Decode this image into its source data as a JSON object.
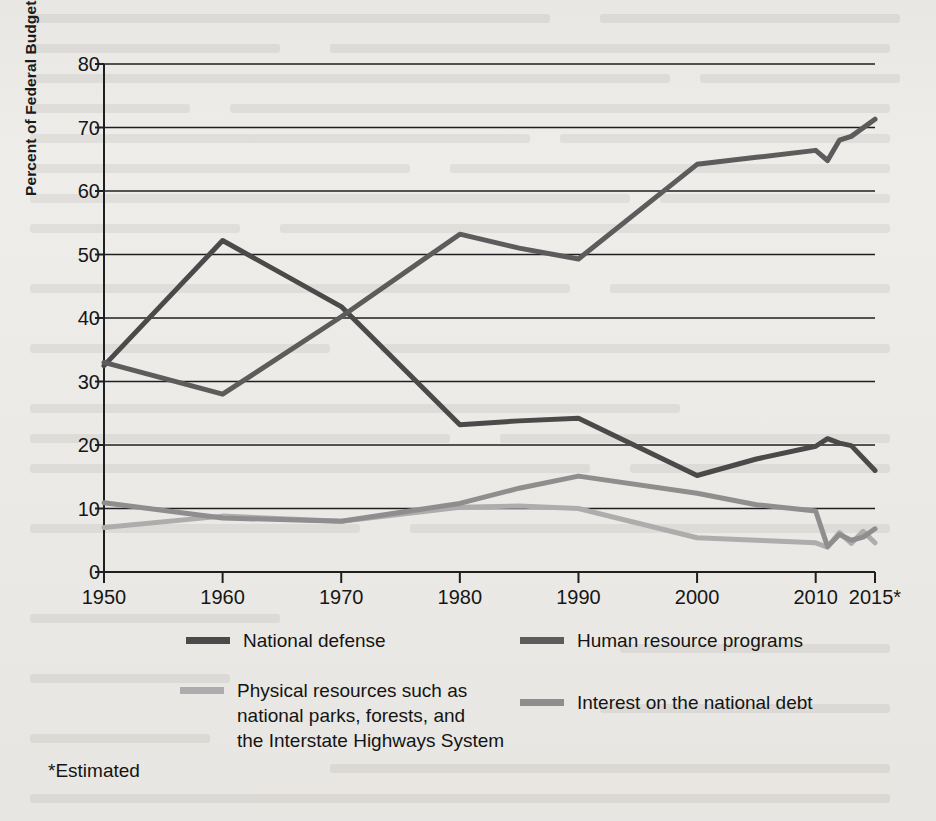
{
  "figure": {
    "y_axis_title": "Percent of Federal Budget",
    "footnote": "*Estimated"
  },
  "legend": {
    "items": [
      {
        "label": "National defense",
        "color": "#4a4a4a"
      },
      {
        "label": "Human resource programs",
        "color": "#5c5c5c"
      },
      {
        "label": "Physical resources such as\nnational parks, forests, and\nthe Interstate Highways System",
        "color": "#adadad"
      },
      {
        "label": "Interest on the national debt",
        "color": "#8e8e8e"
      }
    ]
  },
  "chart_data": {
    "type": "line",
    "title": "",
    "xlabel": "",
    "ylabel": "Percent of Federal Budget",
    "xlim": [
      1950,
      2015
    ],
    "ylim": [
      0,
      80
    ],
    "grid": true,
    "legend_position": "bottom",
    "x_tick_labels": [
      "1950",
      "1960",
      "1970",
      "1980",
      "1990",
      "2000",
      "2010",
      "2015*"
    ],
    "x_ticks": [
      1950,
      1960,
      1970,
      1980,
      1990,
      2000,
      2010,
      2015
    ],
    "y_tick_labels": [
      "0",
      "10",
      "20",
      "30",
      "40",
      "50",
      "60",
      "70",
      "80"
    ],
    "y_ticks": [
      0,
      10,
      20,
      30,
      40,
      50,
      60,
      70,
      80
    ],
    "series": [
      {
        "name": "National defense",
        "color": "#4a4a4a",
        "x": [
          1950,
          1960,
          1970,
          1980,
          1985,
          1990,
          2000,
          2005,
          2010,
          2011,
          2012,
          2013,
          2015
        ],
        "values": [
          32.5,
          52.2,
          41.8,
          23.2,
          23.8,
          24.2,
          15.2,
          17.8,
          19.8,
          21.0,
          20.3,
          19.9,
          16.0
        ]
      },
      {
        "name": "Human resource programs",
        "color": "#5c5c5c",
        "x": [
          1950,
          1960,
          1970,
          1980,
          1985,
          1990,
          2000,
          2005,
          2010,
          2011,
          2012,
          2013,
          2015
        ],
        "values": [
          33.0,
          28.0,
          40.2,
          53.2,
          51.0,
          49.3,
          64.2,
          65.3,
          66.4,
          64.8,
          68.0,
          68.6,
          71.3
        ]
      },
      {
        "name": "Physical resources such as national parks, forests, and the Interstate Highways System",
        "color": "#adadad",
        "x": [
          1950,
          1960,
          1970,
          1980,
          1985,
          1990,
          2000,
          2005,
          2010,
          2011,
          2012,
          2013,
          2014,
          2015
        ],
        "values": [
          7.0,
          8.8,
          8.0,
          10.2,
          10.4,
          10.0,
          5.4,
          5.0,
          4.6,
          3.9,
          6.2,
          4.5,
          6.4,
          4.6
        ]
      },
      {
        "name": "Interest on the national debt",
        "color": "#8e8e8e",
        "x": [
          1950,
          1960,
          1970,
          1980,
          1985,
          1990,
          2000,
          2005,
          2010,
          2011,
          2012,
          2013,
          2014,
          2015
        ],
        "values": [
          10.9,
          8.5,
          8.0,
          10.8,
          13.2,
          15.1,
          12.4,
          10.6,
          9.6,
          4.0,
          5.9,
          5.0,
          5.5,
          6.8
        ]
      }
    ]
  }
}
